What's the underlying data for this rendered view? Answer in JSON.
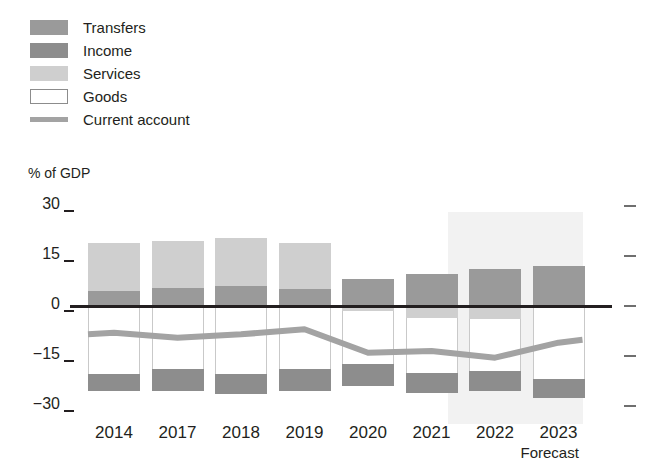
{
  "axis_title": "% of GDP",
  "forecast_label": "Forecast",
  "legend": [
    {
      "key": "transfers",
      "label": "Transfers",
      "color": "#9a9a9a",
      "type": "swatch"
    },
    {
      "key": "income",
      "label": "Income",
      "color": "#8d8d8d",
      "type": "swatch"
    },
    {
      "key": "services",
      "label": "Services",
      "color": "#cfcfcf",
      "type": "swatch"
    },
    {
      "key": "goods",
      "label": "Goods",
      "color": "#ffffff",
      "type": "swatch-outline"
    },
    {
      "key": "current_account",
      "label": "Current account",
      "color": "#a3a3a3",
      "type": "line"
    }
  ],
  "chart_data": {
    "type": "bar",
    "title": "",
    "subtitle": "",
    "xlabel": "",
    "ylabel": "% of GDP",
    "ylim": [
      -30,
      30
    ],
    "yticks": [
      30,
      15,
      0,
      -15,
      -30
    ],
    "grid": false,
    "legend_position": "top-left",
    "stacked": true,
    "categories": [
      "2014",
      "2017",
      "2018",
      "2019",
      "2020",
      "2021",
      "2022",
      "2023"
    ],
    "series": [
      {
        "name": "Transfers",
        "color": "#9a9a9a",
        "values": [
          4.5,
          5.5,
          6.0,
          5.0,
          8.0,
          9.5,
          11.0,
          12.0
        ]
      },
      {
        "name": "Services",
        "color": "#cfcfcf",
        "values": [
          14.5,
          14.0,
          14.5,
          14.0,
          -1.5,
          -3.5,
          -4.0,
          0.0
        ]
      },
      {
        "name": "Goods",
        "color": "#ffffff",
        "values": [
          -20.5,
          -19.0,
          -20.5,
          -19.0,
          -16.0,
          -16.5,
          -15.5,
          -22.0
        ]
      },
      {
        "name": "Income",
        "color": "#8d8d8d",
        "values": [
          -5.0,
          -6.5,
          -6.0,
          -6.5,
          -6.5,
          -6.0,
          -6.0,
          -5.5
        ]
      }
    ],
    "line_series": {
      "name": "Current account",
      "color": "#a3a3a3",
      "values": [
        -8.0,
        -9.5,
        -8.5,
        -7.0,
        -14.0,
        -13.5,
        -15.5,
        -11.0
      ]
    },
    "annotations": [
      {
        "text": "Forecast",
        "covers": [
          "2022",
          "2023"
        ],
        "shaded": true
      }
    ]
  }
}
